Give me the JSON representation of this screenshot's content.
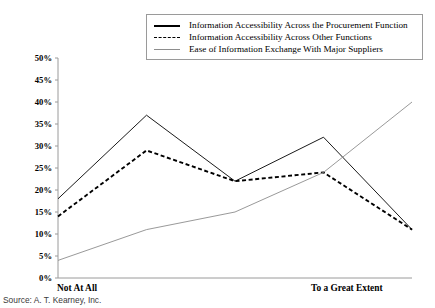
{
  "source_note": "Source: A. T. Kearney, Inc.",
  "legend": {
    "position": "top-right",
    "items": [
      {
        "style": "thick-solid",
        "label": "Information Accessibility Across the Procurement Function"
      },
      {
        "style": "dashed",
        "label": "Information Accessibility Across Other Functions"
      },
      {
        "style": "thin-solid",
        "label": "Ease of Information Exchange With Major Suppliers"
      }
    ]
  },
  "axis": {
    "y_ticks": [
      "50%",
      "45%",
      "40%",
      "35%",
      "30%",
      "25%",
      "20%",
      "15%",
      "10%",
      "5%",
      "0%"
    ],
    "x_left_label": "Not At All",
    "x_right_label": "To a Great Extent"
  },
  "chart_data": {
    "type": "line",
    "title": "",
    "subtitle": "",
    "xlabel": "",
    "ylabel": "",
    "ylim": [
      0,
      50
    ],
    "y_tick_step": 5,
    "y_unit": "%",
    "grid": false,
    "legend_position": "top-right",
    "x": [
      1,
      2,
      3,
      4,
      5
    ],
    "x_tick_labels": [
      "Not At All",
      "",
      "",
      "",
      "To a Great Extent"
    ],
    "x_axis_anchor_labels": {
      "left": "Not At All",
      "right": "To a Great Extent"
    },
    "series": [
      {
        "name": "Information Accessibility Across the Procurement Function",
        "style": "thick-solid",
        "color": "#000000",
        "values": [
          18,
          37,
          22,
          32,
          11
        ]
      },
      {
        "name": "Information Accessibility Across Other Functions",
        "style": "dashed",
        "color": "#000000",
        "values": [
          14,
          29,
          22,
          24,
          11
        ]
      },
      {
        "name": "Ease of Information Exchange With Major Suppliers",
        "style": "thin-solid",
        "color": "#8d8d8d",
        "values": [
          4,
          11,
          15,
          24,
          40
        ]
      }
    ]
  }
}
